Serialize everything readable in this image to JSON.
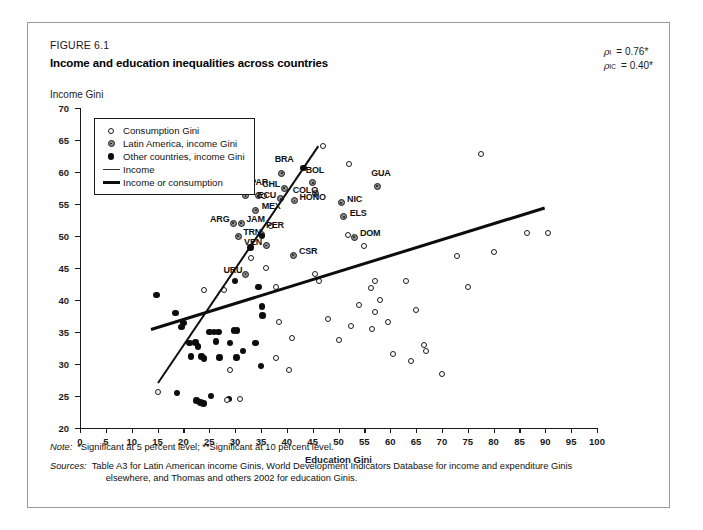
{
  "figure": {
    "number": "FIGURE 6.1",
    "title": "Income and education inequalities across countries"
  },
  "notes": {
    "note_label": "Note:",
    "note_text": "*Significant at 5 percent level; **Significant at 10 percent level.",
    "sources_label": "Sources:",
    "sources_text": "Table A3 for Latin American income Ginis, World Development Indicators Database for income and expenditure Ginis",
    "sources_text2": "elsewhere, and Thomas and others 2002 for education Ginis."
  },
  "annotations": {
    "rho1_symbol": "ρ",
    "rho1_sub": "I",
    "rho1_value": "= 0.76*",
    "rho2_symbol": "ρ",
    "rho2_sub": "IC",
    "rho2_value": "= 0.40*"
  },
  "chart_data": {
    "type": "scatter",
    "title": "Income and education inequalities across countries",
    "xlabel": "Education Gini",
    "ylabel": "Income Gini",
    "xlim": [
      0,
      100
    ],
    "ylim": [
      20,
      70
    ],
    "xticks": [
      0,
      5,
      10,
      15,
      20,
      25,
      30,
      35,
      40,
      45,
      50,
      55,
      60,
      65,
      70,
      75,
      80,
      85,
      90,
      95,
      100
    ],
    "yticks": [
      20,
      25,
      30,
      35,
      40,
      45,
      50,
      55,
      60,
      65,
      70
    ],
    "grid": false,
    "legend_position": "top-left",
    "legend": [
      {
        "label": "Consumption Gini",
        "marker": "hollow-circle"
      },
      {
        "label": "Latin America, income Gini",
        "marker": "grey-dot-circle"
      },
      {
        "label": "Other countries, income Gini",
        "marker": "filled-circle"
      },
      {
        "label": "Income",
        "marker": "thin-line"
      },
      {
        "label": "Income or consumption",
        "marker": "thick-line"
      }
    ],
    "series": [
      {
        "name": "Latin America, income Gini",
        "marker": "grey-dot-circle",
        "points": [
          {
            "label": "PAN",
            "x": 32.0,
            "y": 56.3,
            "lx": -22,
            "ly": -4
          },
          {
            "label": "PAR",
            "x": 34.5,
            "y": 56.3,
            "lx": -8,
            "ly": -14
          },
          {
            "label": "MEX",
            "x": 34.0,
            "y": 54.0,
            "lx": 6,
            "ly": -4
          },
          {
            "label": "ECU",
            "x": 38.8,
            "y": 55.8,
            "lx": -23,
            "ly": -4
          },
          {
            "label": "CHL",
            "x": 39.5,
            "y": 57.5,
            "lx": -22,
            "ly": -4
          },
          {
            "label": "BRA",
            "x": 39.0,
            "y": 59.8,
            "lx": -7,
            "ly": -14
          },
          {
            "label": "HONO",
            "x": 41.5,
            "y": 55.5,
            "lx": 5,
            "ly": -4
          },
          {
            "label": "COLO",
            "x": 45.6,
            "y": 56.6,
            "lx": -23,
            "ly": -4
          },
          {
            "label": "BOL",
            "x": 45.0,
            "y": 58.3,
            "lx": -7,
            "ly": -13
          },
          {
            "label": "NIC",
            "x": 50.5,
            "y": 55.2,
            "lx": 6,
            "ly": -4
          },
          {
            "label": "ELS",
            "x": 51.0,
            "y": 53.0,
            "lx": 6,
            "ly": -4
          },
          {
            "label": "GUA",
            "x": 57.5,
            "y": 57.8,
            "lx": -6,
            "ly": -13
          },
          {
            "label": "ARG",
            "x": 29.6,
            "y": 52.0,
            "lx": -23,
            "ly": -4
          },
          {
            "label": "JAM",
            "x": 31.2,
            "y": 52.0,
            "lx": 5,
            "ly": -4
          },
          {
            "label": "TRN",
            "x": 30.6,
            "y": 50.0,
            "lx": 5,
            "ly": -4
          },
          {
            "label": "PER",
            "x": 35.2,
            "y": 50.2,
            "lx": 4,
            "ly": -10
          },
          {
            "label": "VEN",
            "x": 36.0,
            "y": 48.5,
            "lx": -22,
            "ly": -4
          },
          {
            "label": "CSR",
            "x": 41.2,
            "y": 47.0,
            "lx": 6,
            "ly": -4
          },
          {
            "label": "URU",
            "x": 32.0,
            "y": 44.0,
            "lx": -22,
            "ly": -4
          },
          {
            "label": "DOM",
            "x": 53.0,
            "y": 49.8,
            "lx": 6,
            "ly": -4
          }
        ]
      },
      {
        "name": "Other countries, income Gini",
        "marker": "filled-circle",
        "points": [
          [
            14.8,
            40.8
          ],
          [
            18.5,
            38.0
          ],
          [
            19.6,
            35.8
          ],
          [
            20.0,
            36.4
          ],
          [
            21.2,
            33.3
          ],
          [
            22.3,
            33.4
          ],
          [
            22.8,
            32.7
          ],
          [
            21.5,
            31.2
          ],
          [
            23.5,
            31.2
          ],
          [
            24.0,
            30.9
          ],
          [
            25.0,
            35.0
          ],
          [
            25.9,
            35.0
          ],
          [
            26.3,
            33.5
          ],
          [
            26.8,
            35.0
          ],
          [
            27.0,
            31.0
          ],
          [
            29.0,
            33.3
          ],
          [
            29.8,
            35.2
          ],
          [
            30.4,
            35.2
          ],
          [
            30.3,
            31.0
          ],
          [
            31.5,
            32.0
          ],
          [
            18.8,
            25.5
          ],
          [
            22.5,
            24.3
          ],
          [
            23.3,
            24.0
          ],
          [
            23.9,
            23.8
          ],
          [
            25.3,
            25.0
          ],
          [
            28.8,
            24.5
          ],
          [
            30.0,
            43.0
          ],
          [
            33.0,
            48.2
          ],
          [
            35.2,
            50.0
          ],
          [
            34.5,
            42.0
          ],
          [
            35.2,
            39.0
          ],
          [
            35.3,
            37.6
          ],
          [
            34.0,
            33.3
          ],
          [
            35.0,
            29.7
          ],
          [
            43.2,
            60.6
          ]
        ]
      },
      {
        "name": "Consumption Gini",
        "marker": "hollow-circle",
        "points": [
          [
            15.0,
            25.6
          ],
          [
            29.0,
            29.0
          ],
          [
            28.5,
            24.3
          ],
          [
            31.0,
            24.5
          ],
          [
            35.6,
            56.3
          ],
          [
            37.0,
            51.5
          ],
          [
            36.0,
            45.0
          ],
          [
            24.0,
            41.5
          ],
          [
            27.8,
            41.5
          ],
          [
            33.0,
            46.5
          ],
          [
            38.0,
            42.0
          ],
          [
            38.5,
            36.6
          ],
          [
            38.0,
            31.0
          ],
          [
            40.5,
            29.0
          ],
          [
            41.0,
            34.0
          ],
          [
            45.5,
            44.0
          ],
          [
            46.2,
            43.0
          ],
          [
            47.0,
            64.0
          ],
          [
            52.0,
            61.2
          ],
          [
            51.8,
            50.2
          ],
          [
            48.0,
            37.0
          ],
          [
            50.0,
            33.8
          ],
          [
            52.5,
            36.0
          ],
          [
            54.0,
            39.2
          ],
          [
            55.0,
            48.5
          ],
          [
            56.5,
            35.5
          ],
          [
            57.0,
            43.0
          ],
          [
            56.2,
            41.8
          ],
          [
            57.0,
            38.2
          ],
          [
            58.0,
            40.0
          ],
          [
            59.5,
            36.5
          ],
          [
            60.5,
            31.5
          ],
          [
            63.0,
            43.0
          ],
          [
            64.0,
            30.5
          ],
          [
            65.0,
            38.5
          ],
          [
            66.5,
            33.0
          ],
          [
            67.0,
            32.0
          ],
          [
            70.0,
            28.5
          ],
          [
            73.0,
            46.8
          ],
          [
            75.0,
            42.0
          ],
          [
            77.5,
            62.8
          ],
          [
            80.0,
            47.5
          ],
          [
            86.5,
            50.5
          ],
          [
            90.5,
            50.5
          ]
        ]
      }
    ],
    "trendlines": [
      {
        "name": "Income",
        "x1": 15.0,
        "y1": 27.0,
        "x2": 46.0,
        "y2": 64.0,
        "width": 2.0
      },
      {
        "name": "Income or consumption",
        "x1": 13.8,
        "y1": 35.4,
        "x2": 90.0,
        "y2": 54.4,
        "width": 3.0
      }
    ]
  }
}
